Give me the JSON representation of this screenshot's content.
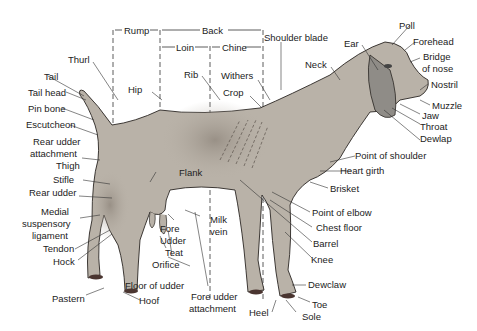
{
  "colors": {
    "body": "#b9b2a8",
    "body_shade": "#8e857b",
    "ear": "#8f8c87",
    "outline": "#2a2622",
    "hoof": "#4a3530",
    "label": "#222222",
    "background": "#ffffff"
  },
  "regions": {
    "rump": "Rump",
    "back": "Back",
    "loin": "Loin",
    "chine": "Chine"
  },
  "labels": {
    "thurl": "Thurl",
    "tail": "Tail",
    "tail_head": "Tail head",
    "pin_bone": "Pin bone",
    "escutcheon": "Escutcheon",
    "rear_udder_attachment_1": "Rear udder",
    "rear_udder_attachment_2": "attachment",
    "thigh": "Thigh",
    "stifle": "Stifle",
    "rear_udder": "Rear udder",
    "medial_1": "Medial",
    "medial_2": "suspensory",
    "medial_3": "ligament",
    "tendon": "Tendon",
    "hock": "Hock",
    "pastern": "Pastern",
    "hoof": "Hoof",
    "floor_of_udder": "Floor of udder",
    "fore_udder_attachment_1": "Fore udder",
    "fore_udder_attachment_2": "attachment",
    "orifice": "Orifice",
    "teat": "Teat",
    "udder": "Udder",
    "fore": "Fore",
    "milk_vein_1": "Milk",
    "milk_vein_2": "vein",
    "flank": "Flank",
    "hip": "Hip",
    "rib": "Rib",
    "withers": "Withers",
    "crop": "Crop",
    "shoulder_blade": "Shoulder blade",
    "neck": "Neck",
    "ear": "Ear",
    "poll": "Poll",
    "forehead": "Forehead",
    "bridge_of_nose_1": "Bridge",
    "bridge_of_nose_2": "of nose",
    "nostril": "Nostril",
    "muzzle": "Muzzle",
    "jaw": "Jaw",
    "throat": "Throat",
    "dewlap": "Dewlap",
    "point_of_shoulder": "Point of shoulder",
    "heart_girth": "Heart girth",
    "brisket": "Brisket",
    "point_of_elbow": "Point of elbow",
    "chest_floor": "Chest floor",
    "barrel": "Barrel",
    "knee": "Knee",
    "dewclaw": "Dewclaw",
    "toe": "Toe",
    "sole": "Sole",
    "heel": "Heel"
  }
}
